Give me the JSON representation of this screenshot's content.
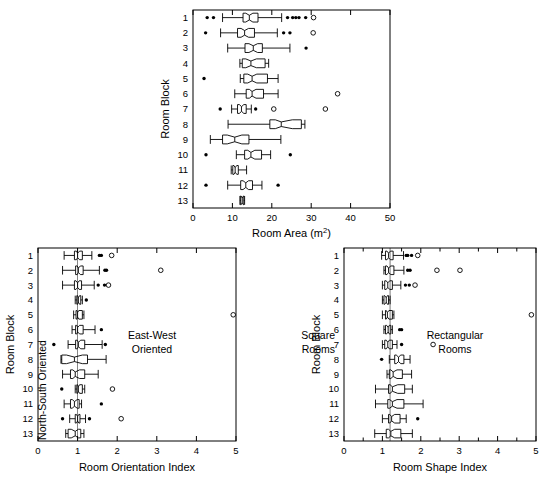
{
  "figure": {
    "title": "",
    "panels": [
      "room-area",
      "room-orientation-index",
      "room-shape-index"
    ]
  },
  "chart_data": [
    {
      "type": "box",
      "id": "room-area",
      "title": "",
      "xlabel": "Room Area (m",
      "xlabel_sup": "2",
      "xlabel_tail": ")",
      "ylabel": "Room Block",
      "xlim": [
        0,
        50
      ],
      "xticks": [
        0,
        10,
        20,
        30,
        40,
        50
      ],
      "xticklabels": [
        "0",
        "10",
        "20",
        "30",
        "40",
        "50"
      ],
      "categories": [
        "1",
        "2",
        "3",
        "4",
        "5",
        "6",
        "7",
        "8",
        "9",
        "10",
        "11",
        "12",
        "13"
      ],
      "grid": false,
      "refline": null,
      "boxes": [
        {
          "cat": "1",
          "whislo": 7.5,
          "q1": 12.7,
          "med": 14.3,
          "q3": 16.5,
          "whishi": 22.5,
          "notchlo": 13.4,
          "notchhi": 15.2,
          "outliers_filled": [
            3.6,
            5.2,
            24.0,
            25.3,
            26.1,
            26.9,
            28.6
          ],
          "outliers_open": [
            30.6
          ]
        },
        {
          "cat": "2",
          "whislo": 7.0,
          "q1": 11.3,
          "med": 13.1,
          "q3": 15.6,
          "whishi": 21.4,
          "notchlo": 12.2,
          "notchhi": 14.1,
          "outliers_filled": [
            3.2,
            23.0,
            24.6
          ],
          "outliers_open": [
            30.5
          ]
        },
        {
          "cat": "3",
          "whislo": 8.8,
          "q1": 13.2,
          "med": 15.3,
          "q3": 17.6,
          "whishi": 24.6,
          "notchlo": 14.2,
          "notchhi": 16.4,
          "outliers_filled": [
            28.7
          ],
          "outliers_open": []
        },
        {
          "cat": "4",
          "whislo": 11.9,
          "q1": 12.5,
          "med": 14.7,
          "q3": 18.3,
          "whishi": 19.2,
          "notchlo": 13.4,
          "notchhi": 16.1,
          "outliers_filled": [],
          "outliers_open": []
        },
        {
          "cat": "5",
          "whislo": 12.0,
          "q1": 12.9,
          "med": 15.0,
          "q3": 18.9,
          "whishi": 21.6,
          "notchlo": 13.9,
          "notchhi": 16.2,
          "outliers_filled": [
            2.8
          ],
          "outliers_open": []
        },
        {
          "cat": "6",
          "whislo": 10.6,
          "q1": 13.5,
          "med": 15.0,
          "q3": 17.9,
          "whishi": 21.6,
          "notchlo": 14.3,
          "notchhi": 16.0,
          "outliers_filled": [],
          "outliers_open": [
            36.7
          ]
        },
        {
          "cat": "7",
          "whislo": 9.8,
          "q1": 11.3,
          "med": 12.3,
          "q3": 13.5,
          "whishi": 14.8,
          "notchlo": 11.8,
          "notchhi": 12.9,
          "outliers_filled": [
            6.9,
            15.9
          ],
          "outliers_open": [
            20.5,
            33.6
          ]
        },
        {
          "cat": "8",
          "whislo": 8.9,
          "q1": 19.5,
          "med": 22.4,
          "q3": 27.5,
          "whishi": 28.4,
          "notchlo": 20.9,
          "notchhi": 25.2,
          "outliers_filled": [],
          "outliers_open": []
        },
        {
          "cat": "9",
          "whislo": 4.4,
          "q1": 7.5,
          "med": 10.6,
          "q3": 14.2,
          "whishi": 22.3,
          "notchlo": 8.7,
          "notchhi": 12.4,
          "outliers_filled": [],
          "outliers_open": []
        },
        {
          "cat": "10",
          "whislo": 11.0,
          "q1": 13.1,
          "med": 14.7,
          "q3": 17.4,
          "whishi": 19.7,
          "notchlo": 13.9,
          "notchhi": 15.7,
          "outliers_filled": [
            3.3,
            24.7
          ],
          "outliers_open": []
        },
        {
          "cat": "11",
          "whislo": 9.7,
          "q1": 10.1,
          "med": 10.7,
          "q3": 11.5,
          "whishi": 13.6,
          "notchlo": 10.4,
          "notchhi": 11.1,
          "outliers_filled": [],
          "outliers_open": []
        },
        {
          "cat": "12",
          "whislo": 8.8,
          "q1": 12.1,
          "med": 13.4,
          "q3": 15.1,
          "whishi": 17.5,
          "notchlo": 12.7,
          "notchhi": 14.1,
          "outliers_filled": [
            3.3,
            21.6
          ],
          "outliers_open": []
        },
        {
          "cat": "13",
          "whislo": 11.9,
          "q1": 12.1,
          "med": 12.5,
          "q3": 12.9,
          "whishi": 13.1,
          "notchlo": 12.2,
          "notchhi": 12.8,
          "outliers_filled": [],
          "outliers_open": []
        }
      ]
    },
    {
      "type": "box",
      "id": "room-orientation-index",
      "title": "",
      "xlabel": "Room Orientation Index",
      "ylabel": "Room Block",
      "xlim": [
        0,
        5
      ],
      "xticks": [
        0,
        1,
        2,
        3,
        4,
        5
      ],
      "xticklabels": [
        "0",
        "1",
        "2",
        "3",
        "4",
        "5"
      ],
      "categories": [
        "1",
        "2",
        "3",
        "4",
        "5",
        "6",
        "7",
        "8",
        "9",
        "10",
        "11",
        "12",
        "13"
      ],
      "grid": false,
      "refline": 1.0,
      "annotations": [
        {
          "text": "North-South Oriented",
          "rotated": true
        },
        {
          "text": "East-West",
          "rotated": false
        },
        {
          "text": "Oriented",
          "rotated": false
        }
      ],
      "boxes": [
        {
          "cat": "1",
          "whislo": 0.66,
          "q1": 0.92,
          "med": 1.0,
          "q3": 1.12,
          "whishi": 1.36,
          "notchlo": 0.97,
          "notchhi": 1.05,
          "outliers_filled": [
            1.55,
            1.6
          ],
          "outliers_open": [
            1.86
          ]
        },
        {
          "cat": "2",
          "whislo": 0.62,
          "q1": 0.95,
          "med": 1.02,
          "q3": 1.14,
          "whishi": 1.55,
          "notchlo": 0.99,
          "notchhi": 1.07,
          "outliers_filled": [
            1.69,
            1.73
          ],
          "outliers_open": [
            3.1
          ]
        },
        {
          "cat": "3",
          "whislo": 0.62,
          "q1": 0.92,
          "med": 1.0,
          "q3": 1.1,
          "whishi": 1.42,
          "notchlo": 0.96,
          "notchhi": 1.04,
          "outliers_filled": [
            1.52,
            1.68
          ],
          "outliers_open": [
            1.78
          ]
        },
        {
          "cat": "4",
          "whislo": 0.94,
          "q1": 0.98,
          "med": 1.02,
          "q3": 1.08,
          "whishi": 1.12,
          "notchlo": 1.0,
          "notchhi": 1.05,
          "outliers_filled": [
            1.22
          ],
          "outliers_open": []
        },
        {
          "cat": "5",
          "whislo": 0.9,
          "q1": 0.96,
          "med": 1.0,
          "q3": 1.12,
          "whishi": 1.16,
          "notchlo": 0.98,
          "notchhi": 1.03,
          "outliers_filled": [],
          "outliers_open": [
            4.93
          ]
        },
        {
          "cat": "6",
          "whislo": 0.86,
          "q1": 0.95,
          "med": 1.0,
          "q3": 1.14,
          "whishi": 1.44,
          "notchlo": 0.98,
          "notchhi": 1.05,
          "outliers_filled": [
            1.6
          ],
          "outliers_open": []
        },
        {
          "cat": "7",
          "whislo": 0.76,
          "q1": 0.95,
          "med": 1.02,
          "q3": 1.18,
          "whishi": 1.62,
          "notchlo": 0.99,
          "notchhi": 1.08,
          "outliers_filled": [
            0.4,
            1.7
          ],
          "outliers_open": []
        },
        {
          "cat": "8",
          "whislo": 0.58,
          "q1": 0.6,
          "med": 0.92,
          "q3": 1.25,
          "whishi": 1.72,
          "notchlo": 0.72,
          "notchhi": 1.12,
          "outliers_filled": [],
          "outliers_open": []
        },
        {
          "cat": "9",
          "whislo": 0.62,
          "q1": 0.82,
          "med": 0.94,
          "q3": 1.18,
          "whishi": 1.52,
          "notchlo": 0.88,
          "notchhi": 1.05,
          "outliers_filled": [],
          "outliers_open": []
        },
        {
          "cat": "10",
          "whislo": 0.94,
          "q1": 0.98,
          "med": 1.02,
          "q3": 1.12,
          "whishi": 1.18,
          "notchlo": 1.0,
          "notchhi": 1.05,
          "outliers_filled": [
            0.6
          ],
          "outliers_open": [
            1.88
          ]
        },
        {
          "cat": "11",
          "whislo": 0.66,
          "q1": 0.82,
          "med": 0.92,
          "q3": 1.04,
          "whishi": 1.1,
          "notchlo": 0.87,
          "notchhi": 0.99,
          "outliers_filled": [
            1.6
          ],
          "outliers_open": []
        },
        {
          "cat": "12",
          "whislo": 0.8,
          "q1": 0.94,
          "med": 1.0,
          "q3": 1.06,
          "whishi": 1.2,
          "notchlo": 0.97,
          "notchhi": 1.03,
          "outliers_filled": [
            0.62,
            1.3
          ],
          "outliers_open": [
            2.1
          ]
        },
        {
          "cat": "13",
          "whislo": 0.7,
          "q1": 0.76,
          "med": 0.94,
          "q3": 1.08,
          "whishi": 1.16,
          "notchlo": 0.84,
          "notchhi": 1.02,
          "outliers_filled": [],
          "outliers_open": []
        }
      ]
    },
    {
      "type": "box",
      "id": "room-shape-index",
      "title": "",
      "xlabel": "Room Shape Index",
      "ylabel": "Room Block",
      "xlim": [
        0,
        5
      ],
      "xticks": [
        0,
        1,
        2,
        3,
        4,
        5
      ],
      "xticklabels": [
        "0",
        "1",
        "2",
        "3",
        "4",
        "5"
      ],
      "minor_ticks": true,
      "categories": [
        "1",
        "2",
        "3",
        "4",
        "5",
        "6",
        "7",
        "8",
        "9",
        "10",
        "11",
        "12",
        "13"
      ],
      "grid": false,
      "refline": 1.2,
      "annotations": [
        {
          "text": "Square",
          "rotated": false
        },
        {
          "text": "Rooms",
          "rotated": false
        },
        {
          "text": "Rectangular",
          "rotated": false
        },
        {
          "text": "Rooms",
          "rotated": false
        }
      ],
      "boxes": [
        {
          "cat": "1",
          "whislo": 0.98,
          "q1": 1.08,
          "med": 1.16,
          "q3": 1.28,
          "whishi": 1.55,
          "notchlo": 1.12,
          "notchhi": 1.21,
          "outliers_filled": [
            1.62,
            1.66,
            1.76
          ],
          "outliers_open": [
            1.92
          ]
        },
        {
          "cat": "2",
          "whislo": 1.04,
          "q1": 1.08,
          "med": 1.16,
          "q3": 1.3,
          "whishi": 1.56,
          "notchlo": 1.12,
          "notchhi": 1.22,
          "outliers_filled": [
            1.66,
            1.72
          ],
          "outliers_open": [
            2.42,
            3.02
          ]
        },
        {
          "cat": "3",
          "whislo": 1.0,
          "q1": 1.06,
          "med": 1.14,
          "q3": 1.26,
          "whishi": 1.48,
          "notchlo": 1.1,
          "notchhi": 1.19,
          "outliers_filled": [
            1.6,
            1.7
          ],
          "outliers_open": [
            1.85
          ]
        },
        {
          "cat": "4",
          "whislo": 1.0,
          "q1": 1.04,
          "med": 1.1,
          "q3": 1.16,
          "whishi": 1.2,
          "notchlo": 1.06,
          "notchhi": 1.13,
          "outliers_filled": [],
          "outliers_open": []
        },
        {
          "cat": "5",
          "whislo": 1.0,
          "q1": 1.08,
          "med": 1.13,
          "q3": 1.26,
          "whishi": 1.3,
          "notchlo": 1.1,
          "notchhi": 1.17,
          "outliers_filled": [],
          "outliers_open": [
            4.88
          ]
        },
        {
          "cat": "6",
          "whislo": 1.04,
          "q1": 1.08,
          "med": 1.15,
          "q3": 1.22,
          "whishi": 1.26,
          "notchlo": 1.11,
          "notchhi": 1.18,
          "outliers_filled": [
            1.45,
            1.5
          ],
          "outliers_open": []
        },
        {
          "cat": "7",
          "whislo": 1.0,
          "q1": 1.06,
          "med": 1.14,
          "q3": 1.26,
          "whishi": 1.38,
          "notchlo": 1.1,
          "notchhi": 1.18,
          "outliers_filled": [
            1.5
          ],
          "outliers_open": [
            2.32
          ]
        },
        {
          "cat": "8",
          "whislo": 1.18,
          "q1": 1.32,
          "med": 1.42,
          "q3": 1.56,
          "whishi": 1.72,
          "notchlo": 1.36,
          "notchhi": 1.48,
          "outliers_filled": [
            0.98
          ],
          "outliers_open": []
        },
        {
          "cat": "9",
          "whislo": 1.12,
          "q1": 1.18,
          "med": 1.28,
          "q3": 1.52,
          "whishi": 1.76,
          "notchlo": 1.22,
          "notchhi": 1.38,
          "outliers_filled": [],
          "outliers_open": []
        },
        {
          "cat": "10",
          "whislo": 0.82,
          "q1": 1.16,
          "med": 1.26,
          "q3": 1.58,
          "whishi": 1.78,
          "notchlo": 1.2,
          "notchhi": 1.4,
          "outliers_filled": [],
          "outliers_open": []
        },
        {
          "cat": "11",
          "whislo": 0.82,
          "q1": 1.14,
          "med": 1.26,
          "q3": 1.56,
          "whishi": 2.06,
          "notchlo": 1.19,
          "notchhi": 1.38,
          "outliers_filled": [],
          "outliers_open": []
        },
        {
          "cat": "12",
          "whislo": 1.0,
          "q1": 1.16,
          "med": 1.24,
          "q3": 1.46,
          "whishi": 1.62,
          "notchlo": 1.19,
          "notchhi": 1.32,
          "outliers_filled": [
            1.92
          ],
          "outliers_open": []
        },
        {
          "cat": "13",
          "whislo": 0.8,
          "q1": 1.1,
          "med": 1.22,
          "q3": 1.48,
          "whishi": 1.78,
          "notchlo": 1.16,
          "notchhi": 1.32,
          "outliers_filled": [],
          "outliers_open": []
        }
      ]
    }
  ]
}
